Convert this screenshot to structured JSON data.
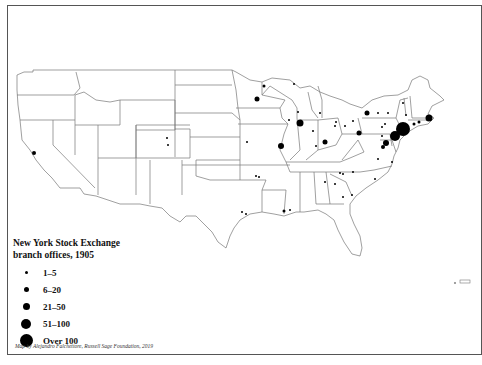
{
  "map": {
    "title_line1": "New York Stock Exchange",
    "title_line2": "branch offices, 1905",
    "credit": "Map by Alejandro Falchettore, Russell Sage Foundation, 2019",
    "colors": {
      "dot": "#000000",
      "border": "#555555",
      "state_line": "#777777",
      "background": "#ffffff"
    }
  },
  "legend": {
    "items": [
      {
        "label": "1–5",
        "size": 3
      },
      {
        "label": "6–20",
        "size": 5
      },
      {
        "label": "21–50",
        "size": 7
      },
      {
        "label": "51–100",
        "size": 10
      },
      {
        "label": "Over 100",
        "size": 13
      }
    ]
  },
  "offices": [
    {
      "name": "San Francisco",
      "x": 34,
      "y": 153,
      "size": 4
    },
    {
      "name": "Denver",
      "x": 167,
      "y": 138,
      "size": 2
    },
    {
      "name": "Colorado Springs",
      "x": 168,
      "y": 145,
      "size": 2
    },
    {
      "name": "Minneapolis",
      "x": 257,
      "y": 99,
      "size": 5
    },
    {
      "name": "Duluth",
      "x": 264,
      "y": 86,
      "size": 3
    },
    {
      "name": "Marquette",
      "x": 294,
      "y": 84,
      "size": 2
    },
    {
      "name": "Milwaukee",
      "x": 298,
      "y": 112,
      "size": 2
    },
    {
      "name": "Chicago",
      "x": 300,
      "y": 123,
      "size": 7
    },
    {
      "name": "Rockford",
      "x": 289,
      "y": 120,
      "size": 2
    },
    {
      "name": "Grand Rapids",
      "x": 320,
      "y": 113,
      "size": 2
    },
    {
      "name": "Detroit",
      "x": 336,
      "y": 122,
      "size": 2
    },
    {
      "name": "Toledo",
      "x": 335,
      "y": 126,
      "size": 2
    },
    {
      "name": "Cleveland",
      "x": 353,
      "y": 121,
      "size": 2
    },
    {
      "name": "Buffalo",
      "x": 367,
      "y": 113,
      "size": 5
    },
    {
      "name": "Rochester",
      "x": 378,
      "y": 113,
      "size": 2
    },
    {
      "name": "Syracuse",
      "x": 388,
      "y": 113,
      "size": 2
    },
    {
      "name": "Albany",
      "x": 406,
      "y": 115,
      "size": 2
    },
    {
      "name": "Burlington",
      "x": 403,
      "y": 103,
      "size": 2
    },
    {
      "name": "Pittsburgh",
      "x": 359,
      "y": 133,
      "size": 5
    },
    {
      "name": "Columbus",
      "x": 345,
      "y": 126,
      "size": 2
    },
    {
      "name": "Cincinnati",
      "x": 325,
      "y": 142,
      "size": 5
    },
    {
      "name": "Indianapolis",
      "x": 313,
      "y": 131,
      "size": 2
    },
    {
      "name": "Louisville",
      "x": 316,
      "y": 146,
      "size": 2
    },
    {
      "name": "St. Louis",
      "x": 281,
      "y": 146,
      "size": 6
    },
    {
      "name": "Kansas City",
      "x": 247,
      "y": 142,
      "size": 2
    },
    {
      "name": "Scranton",
      "x": 385,
      "y": 124,
      "size": 2
    },
    {
      "name": "Wilkes-Barre",
      "x": 382,
      "y": 127,
      "size": 2
    },
    {
      "name": "Harrisburg",
      "x": 382,
      "y": 136,
      "size": 2
    },
    {
      "name": "Philadelphia",
      "x": 395,
      "y": 136,
      "size": 10
    },
    {
      "name": "New York",
      "x": 403,
      "y": 129,
      "size": 14
    },
    {
      "name": "New Haven",
      "x": 414,
      "y": 124,
      "size": 3
    },
    {
      "name": "Hartford",
      "x": 419,
      "y": 122,
      "size": 3
    },
    {
      "name": "Boston",
      "x": 429,
      "y": 118,
      "size": 7
    },
    {
      "name": "Baltimore",
      "x": 386,
      "y": 143,
      "size": 6
    },
    {
      "name": "Washington",
      "x": 383,
      "y": 147,
      "size": 4
    },
    {
      "name": "Richmond",
      "x": 378,
      "y": 159,
      "size": 2
    },
    {
      "name": "Norfolk",
      "x": 392,
      "y": 162,
      "size": 2
    },
    {
      "name": "Memphis",
      "x": 256,
      "y": 176,
      "size": 2
    },
    {
      "name": "Little Rock",
      "x": 259,
      "y": 177,
      "size": 2
    },
    {
      "name": "Atlanta",
      "x": 325,
      "y": 182,
      "size": 2
    },
    {
      "name": "Charlotte",
      "x": 340,
      "y": 173,
      "size": 2
    },
    {
      "name": "Raleigh",
      "x": 353,
      "y": 172,
      "size": 2
    },
    {
      "name": "Wilmington NC",
      "x": 375,
      "y": 179,
      "size": 2
    },
    {
      "name": "Augusta",
      "x": 335,
      "y": 184,
      "size": 2
    },
    {
      "name": "Columbia",
      "x": 343,
      "y": 174,
      "size": 2
    },
    {
      "name": "Charleston",
      "x": 352,
      "y": 195,
      "size": 2
    },
    {
      "name": "Savannah",
      "x": 343,
      "y": 197,
      "size": 2
    },
    {
      "name": "Houston",
      "x": 242,
      "y": 212,
      "size": 2
    },
    {
      "name": "Galveston",
      "x": 246,
      "y": 214,
      "size": 2
    },
    {
      "name": "New Orleans",
      "x": 284,
      "y": 211,
      "size": 3
    },
    {
      "name": "Mobile",
      "x": 290,
      "y": 210,
      "size": 2
    }
  ]
}
